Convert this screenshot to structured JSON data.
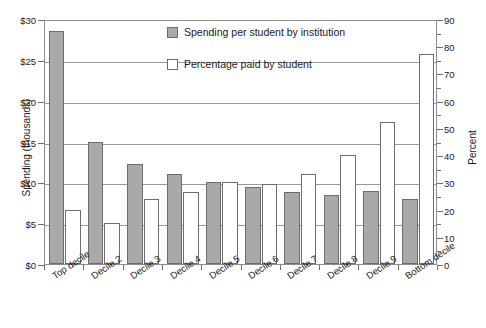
{
  "chart_data": {
    "type": "bar",
    "title": "",
    "xlabel": "",
    "ylabel": "Spending (thousands)",
    "y2label": "Percent",
    "ylim": [
      0,
      30
    ],
    "y2lim": [
      0,
      90
    ],
    "grid": true,
    "legend_position": "top-center",
    "categories": [
      "Top decile",
      "Decile 2",
      "Decile 3",
      "Decile 4",
      "Decile 5",
      "Decile 6",
      "Decile 7",
      "Decile 8",
      "Decile 9",
      "Bottom decile"
    ],
    "series": [
      {
        "name": "Spending per student by institution",
        "axis": "left",
        "unit": "thousands of dollars",
        "color": "#a9a9a9",
        "values": [
          28.5,
          15.0,
          12.3,
          11.0,
          10.0,
          9.4,
          8.8,
          8.5,
          8.9,
          8.0
        ]
      },
      {
        "name": "Percentage paid by student",
        "axis": "right",
        "unit": "percent",
        "color": "#ffffff",
        "values": [
          20.0,
          15.0,
          24.0,
          26.5,
          30.0,
          29.5,
          33.0,
          40.0,
          52.0,
          77.0
        ]
      }
    ],
    "y_ticks": [
      "$0",
      "$5",
      "$10",
      "$15",
      "$20",
      "$25",
      "$30"
    ],
    "y_tick_values": [
      0,
      5,
      10,
      15,
      20,
      25,
      30
    ],
    "y2_ticks": [
      "0",
      "10",
      "20",
      "30",
      "40",
      "50",
      "60",
      "70",
      "80",
      "90"
    ],
    "y2_tick_values": [
      0,
      10,
      20,
      30,
      40,
      50,
      60,
      70,
      80,
      90
    ],
    "y2_minor_tick_values": [
      5,
      15,
      25,
      35,
      45,
      55,
      65,
      75,
      85
    ]
  },
  "legend": {
    "items": [
      {
        "label": "Spending per student by institution",
        "swatch": "gray"
      },
      {
        "label": "Percentage paid by student",
        "swatch": "white"
      }
    ]
  }
}
